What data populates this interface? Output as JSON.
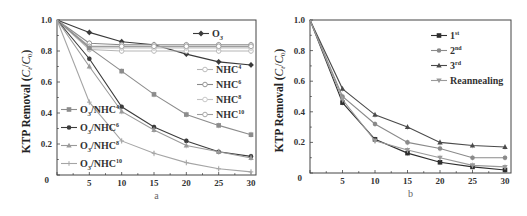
{
  "chart_data": [
    {
      "panel": "a",
      "type": "line",
      "title": "",
      "xlabel": "a",
      "ylabel": "KTP Removal (C_t/C_0)",
      "xlim": [
        0,
        30
      ],
      "ylim": [
        0,
        1.0
      ],
      "x": [
        0,
        5,
        10,
        15,
        20,
        25,
        30
      ],
      "xticks": [
        "5",
        "10",
        "15",
        "20",
        "25",
        "30"
      ],
      "yticks": [
        "0",
        "0.2",
        "0.4",
        "0.6",
        "0.8",
        "1.0"
      ],
      "grid": false,
      "series": [
        {
          "name": "O3",
          "label_main": "O",
          "label_sub": "3",
          "label_sup": "",
          "values": [
            1.0,
            0.92,
            0.86,
            0.84,
            0.78,
            0.73,
            0.71
          ],
          "marker": "diamond",
          "color": "#3a3a3a"
        },
        {
          "name": "NHC4",
          "label_main": "NHC",
          "label_sub": "",
          "label_sup": "4",
          "values": [
            1.0,
            0.81,
            0.8,
            0.8,
            0.8,
            0.8,
            0.8
          ],
          "marker": "circle-open",
          "color": "#b5b5b5"
        },
        {
          "name": "NHC6",
          "label_main": "NHC",
          "label_sub": "",
          "label_sup": "6",
          "values": [
            1.0,
            0.85,
            0.84,
            0.84,
            0.84,
            0.84,
            0.84
          ],
          "marker": "circle-open",
          "color": "#8a8a8a"
        },
        {
          "name": "NHC8",
          "label_main": "NHC",
          "label_sub": "",
          "label_sup": "8",
          "values": [
            1.0,
            0.82,
            0.82,
            0.82,
            0.82,
            0.82,
            0.82
          ],
          "marker": "circle-open",
          "color": "#c2c2c2"
        },
        {
          "name": "NHC10",
          "label_main": "NHC",
          "label_sub": "",
          "label_sup": "10",
          "values": [
            1.0,
            0.83,
            0.83,
            0.83,
            0.83,
            0.83,
            0.83
          ],
          "marker": "circle-open",
          "color": "#9e9e9e"
        },
        {
          "name": "O3/NHC4",
          "label_main": "O",
          "label_sub": "3",
          "label_tail": "/NHC",
          "label_sup": "4",
          "values": [
            1.0,
            0.82,
            0.67,
            0.52,
            0.39,
            0.32,
            0.26
          ],
          "marker": "square",
          "color": "#8c8c8c"
        },
        {
          "name": "O3/NHC6",
          "label_main": "O",
          "label_sub": "3",
          "label_tail": "/NHC",
          "label_sup": "6",
          "values": [
            1.0,
            0.75,
            0.44,
            0.31,
            0.22,
            0.15,
            0.12
          ],
          "marker": "circle",
          "color": "#3c3c3c"
        },
        {
          "name": "O3/NHC8",
          "label_main": "O",
          "label_sub": "3",
          "label_tail": "/NHC",
          "label_sup": "8",
          "values": [
            1.0,
            0.7,
            0.41,
            0.29,
            0.19,
            0.15,
            0.11
          ],
          "marker": "triangle",
          "color": "#9a9a9a"
        },
        {
          "name": "O3/NHC10",
          "label_main": "O",
          "label_sub": "3",
          "label_tail": "/NHC",
          "label_sup": "10",
          "values": [
            1.0,
            0.47,
            0.22,
            0.14,
            0.08,
            0.04,
            0.02
          ],
          "marker": "star",
          "color": "#a5a5a5"
        }
      ],
      "legend": {
        "position": "split: O3 + NHC series right, O3/NHC series lower-left"
      }
    },
    {
      "panel": "b",
      "type": "line",
      "title": "",
      "xlabel": "b",
      "ylabel": "KTP Removal (C_t/C_0)",
      "xlim": [
        0,
        30
      ],
      "ylim": [
        0,
        1.0
      ],
      "x": [
        0,
        5,
        10,
        15,
        20,
        25,
        30
      ],
      "xticks": [
        "5",
        "10",
        "15",
        "20",
        "25",
        "30"
      ],
      "yticks": [
        "0",
        "0.2",
        "0.4",
        "0.6",
        "0.8",
        "1.0"
      ],
      "grid": false,
      "series": [
        {
          "name": "1st",
          "label_main": "1",
          "label_sup": "st",
          "values": [
            1.0,
            0.46,
            0.22,
            0.13,
            0.07,
            0.04,
            0.02
          ],
          "marker": "square",
          "color": "#2e2e2e"
        },
        {
          "name": "2nd",
          "label_main": "2",
          "label_sup": "nd",
          "values": [
            1.0,
            0.5,
            0.32,
            0.2,
            0.16,
            0.1,
            0.1
          ],
          "marker": "circle",
          "color": "#8a8a8a"
        },
        {
          "name": "3rd",
          "label_main": "3",
          "label_sup": "rd",
          "values": [
            1.0,
            0.55,
            0.38,
            0.3,
            0.2,
            0.18,
            0.17
          ],
          "marker": "triangle",
          "color": "#4a4a4a"
        },
        {
          "name": "Reannealing",
          "label_main": "Reannealing",
          "label_sup": "",
          "values": [
            1.0,
            0.48,
            0.21,
            0.15,
            0.1,
            0.05,
            0.04
          ],
          "marker": "triangle-down",
          "color": "#9a9a9a"
        }
      ],
      "legend": {
        "position": "upper right"
      }
    }
  ],
  "labels": {
    "ylabel_text": "KTP Removal (",
    "ylabel_ct": "C",
    "ylabel_t": "t",
    "ylabel_slash": "/",
    "ylabel_c0": "C",
    "ylabel_0": "0",
    "ylabel_close": ")",
    "panel_a": "a",
    "panel_b": "b",
    "origin": "0"
  }
}
